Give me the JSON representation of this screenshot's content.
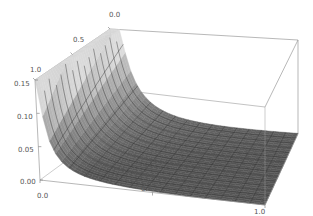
{
  "chart_data": {
    "type": "surface3d",
    "title": "",
    "xlabel": "",
    "ylabel": "",
    "zlabel": "",
    "x_range": [
      0.0,
      1.0
    ],
    "y_range": [
      0.0,
      1.0
    ],
    "z_range": [
      0.0,
      0.15
    ],
    "x_ticks": [
      "0.0",
      "0.5",
      "1.0"
    ],
    "y_ticks": [
      "0.0",
      "0.5",
      "1.0"
    ],
    "z_ticks": [
      "0.00",
      "0.05",
      "0.10",
      "0.15"
    ],
    "mesh": {
      "x_lines": 15,
      "y_lines": 15
    },
    "surface_description": "Surface rises steeply toward x=0 and is clipped at z=0.15; near-flat (~0) for large x",
    "colors": {
      "surface_light": "#e6e6e6",
      "surface_dark": "#5a5a5a",
      "mesh": "#333333",
      "box": "#9a9a9a",
      "clip_top": "#d8d8d8"
    }
  }
}
